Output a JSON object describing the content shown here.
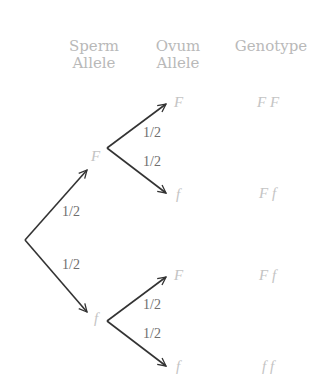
{
  "headers": {
    "sperm": "Sperm Allele",
    "sperm_l1": "Sperm",
    "sperm_l2": "Allele",
    "ovum_l1": "Ovum",
    "ovum_l2": "Allele",
    "genotype": "Genotype"
  },
  "sperm_alleles": [
    "F",
    "f"
  ],
  "ovum_alleles": [
    "F",
    "f",
    "F",
    "f"
  ],
  "genotypes": [
    "F F",
    "F f",
    "F f",
    "f f"
  ],
  "probabilities": {
    "root_up": "1/2",
    "root_down": "1/2",
    "F_up": "1/2",
    "F_down": "1/2",
    "f_up": "1/2",
    "f_down": "1/2"
  },
  "colors": {
    "arrow": "#333333",
    "label": "#c4c4c4",
    "prob": "#6e6e6e"
  }
}
